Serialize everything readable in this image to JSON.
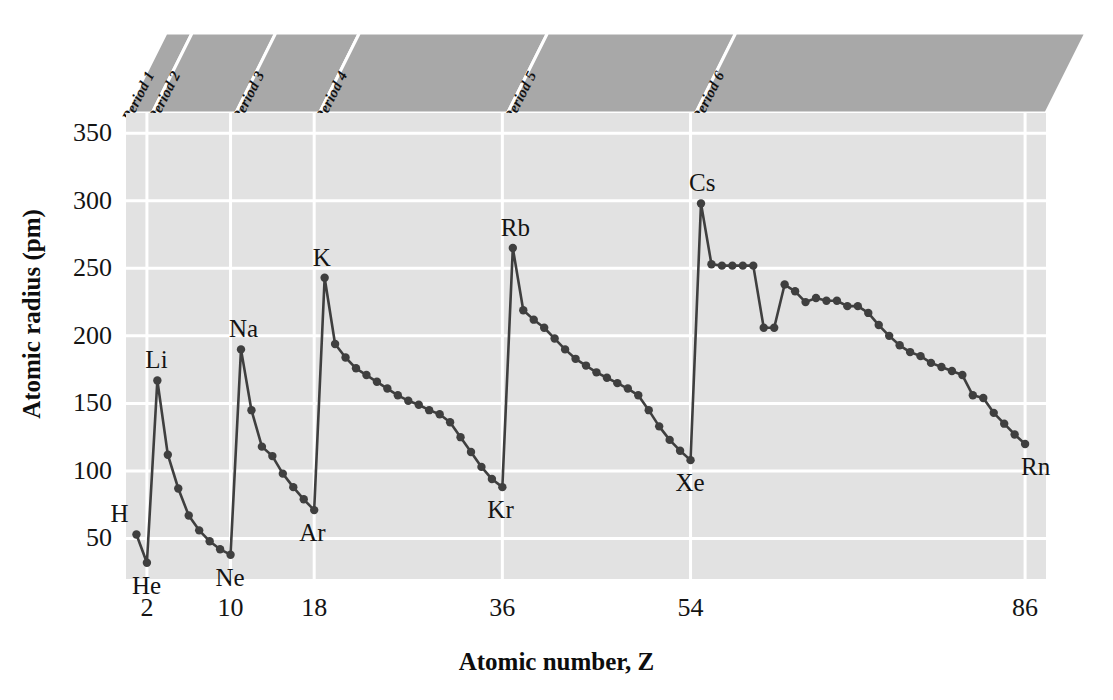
{
  "chart_data": {
    "type": "line",
    "title": "",
    "xlabel": "Atomic number, Z",
    "ylabel": "Atomic radius (pm)",
    "xlim": [
      0,
      88
    ],
    "ylim": [
      20,
      365
    ],
    "grid": true,
    "legend": "none",
    "xticks": [
      2,
      10,
      18,
      36,
      54,
      86
    ],
    "xtick_labels": [
      "2",
      "10",
      "18",
      "36",
      "54",
      "86"
    ],
    "yticks": [
      50,
      100,
      150,
      200,
      250,
      300,
      350
    ],
    "ytick_labels": [
      "50",
      "100",
      "150",
      "200",
      "250",
      "300",
      "350"
    ],
    "series": [
      {
        "name": "Atomic radius",
        "marker": "circle",
        "color": "#3f3f3f",
        "x": [
          1,
          2,
          3,
          4,
          5,
          6,
          7,
          8,
          9,
          10,
          11,
          12,
          13,
          14,
          15,
          16,
          17,
          18,
          19,
          20,
          21,
          22,
          23,
          24,
          25,
          26,
          27,
          28,
          29,
          30,
          31,
          32,
          33,
          34,
          35,
          36,
          37,
          38,
          39,
          40,
          41,
          42,
          43,
          44,
          45,
          46,
          47,
          48,
          49,
          50,
          51,
          52,
          53,
          54,
          55,
          56,
          57,
          58,
          59,
          60,
          61,
          62,
          63,
          64,
          65,
          66,
          67,
          68,
          69,
          70,
          71,
          72,
          73,
          74,
          75,
          76,
          77,
          78,
          79,
          80,
          81,
          82,
          83,
          84,
          85,
          86
        ],
        "y": [
          53,
          32,
          167,
          112,
          87,
          67,
          56,
          48,
          42,
          38,
          190,
          145,
          118,
          111,
          98,
          88,
          79,
          71,
          243,
          194,
          184,
          176,
          171,
          166,
          161,
          156,
          152,
          149,
          145,
          142,
          136,
          125,
          114,
          103,
          94,
          88,
          265,
          219,
          212,
          206,
          198,
          190,
          183,
          178,
          173,
          169,
          165,
          161,
          156,
          145,
          133,
          123,
          115,
          108,
          298,
          253,
          252,
          252,
          252,
          252,
          206,
          206,
          238,
          233,
          225,
          228,
          226,
          226,
          222,
          222,
          217,
          208,
          200,
          193,
          188,
          185,
          180,
          177,
          174,
          171,
          156,
          154,
          143,
          135,
          127,
          120
        ]
      }
    ],
    "point_labels": [
      {
        "element": "H",
        "z": 1,
        "radius": 53,
        "pos": "above-left"
      },
      {
        "element": "He",
        "z": 2,
        "radius": 32,
        "pos": "below"
      },
      {
        "element": "Li",
        "z": 3,
        "radius": 167,
        "pos": "above"
      },
      {
        "element": "Ne",
        "z": 10,
        "radius": 38,
        "pos": "below"
      },
      {
        "element": "Na",
        "z": 11,
        "radius": 190,
        "pos": "above"
      },
      {
        "element": "Ar",
        "z": 18,
        "radius": 71,
        "pos": "below"
      },
      {
        "element": "K",
        "z": 19,
        "radius": 243,
        "pos": "above"
      },
      {
        "element": "Kr",
        "z": 36,
        "radius": 88,
        "pos": "below"
      },
      {
        "element": "Rb",
        "z": 37,
        "radius": 265,
        "pos": "above"
      },
      {
        "element": "Xe",
        "z": 54,
        "radius": 108,
        "pos": "below"
      },
      {
        "element": "Cs",
        "z": 55,
        "radius": 298,
        "pos": "above"
      },
      {
        "element": "Rn",
        "z": 86,
        "radius": 120,
        "pos": "below-right"
      }
    ],
    "period_bands": [
      {
        "label": "Period 1",
        "z_start": 1,
        "z_end": 2
      },
      {
        "label": "Period 2",
        "z_start": 3,
        "z_end": 10
      },
      {
        "label": "Period 3",
        "z_start": 11,
        "z_end": 18
      },
      {
        "label": "Period 4",
        "z_start": 19,
        "z_end": 36
      },
      {
        "label": "Period 5",
        "z_start": 37,
        "z_end": 54
      },
      {
        "label": "Period 6",
        "z_start": 55,
        "z_end": 86
      }
    ],
    "colors": {
      "plot_background": "#e2e2e2",
      "gridline": "#ffffff",
      "banner_background": "#a8a8a8",
      "line": "#3f3f3f",
      "text": "#141414"
    }
  },
  "axes": {
    "xlabel": "Atomic number, Z",
    "ylabel": "Atomic radius (pm)"
  }
}
